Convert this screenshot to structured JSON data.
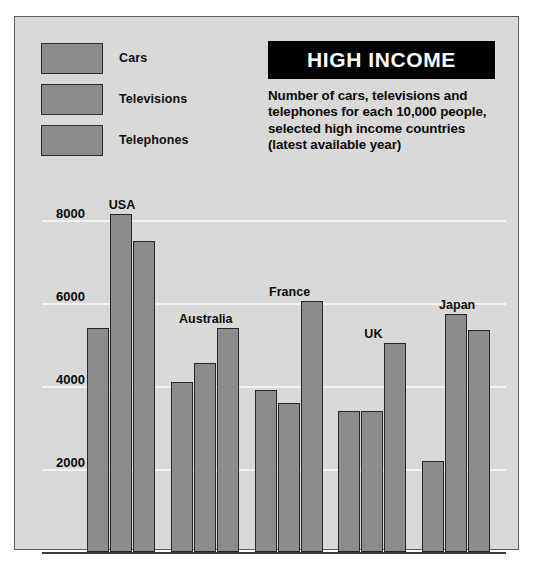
{
  "title": "HIGH INCOME",
  "subtitle": "Number of cars, televisions and telephones for each 10,000 people, selected high income countries (latest available year)",
  "legend": {
    "items": [
      {
        "label": "Cars",
        "color": "#8c8c8c"
      },
      {
        "label": "Televisions",
        "color": "#8c8c8c"
      },
      {
        "label": "Telephones",
        "color": "#8c8c8c"
      }
    ]
  },
  "axis": {
    "yticks": [
      "2000",
      "4000",
      "6000",
      "8000"
    ]
  },
  "chart_data": {
    "type": "bar",
    "title": "HIGH INCOME",
    "subtitle": "Number of cars, televisions and telephones for each 10,000 people, selected high income countries (latest available year)",
    "xlabel": "",
    "ylabel": "",
    "ylim": [
      0,
      8800
    ],
    "yticks": [
      2000,
      4000,
      6000,
      8000
    ],
    "grid": true,
    "legend_position": "top-left",
    "categories": [
      "USA",
      "Australia",
      "France",
      "UK",
      "Japan"
    ],
    "series": [
      {
        "name": "Cars",
        "values": [
          5400,
          4100,
          3900,
          3400,
          2200
        ]
      },
      {
        "name": "Televisions",
        "values": [
          8150,
          4550,
          3600,
          3400,
          5750
        ]
      },
      {
        "name": "Telephones",
        "values": [
          7500,
          5400,
          6050,
          5050,
          5350
        ]
      }
    ]
  },
  "colors": {
    "background": "#d9d9d7",
    "bar_fill": "#8c8c8c",
    "bar_stroke": "#262626",
    "banner": "#000000",
    "gridline": "#f2f2f0",
    "text": "#0b0b0b"
  }
}
